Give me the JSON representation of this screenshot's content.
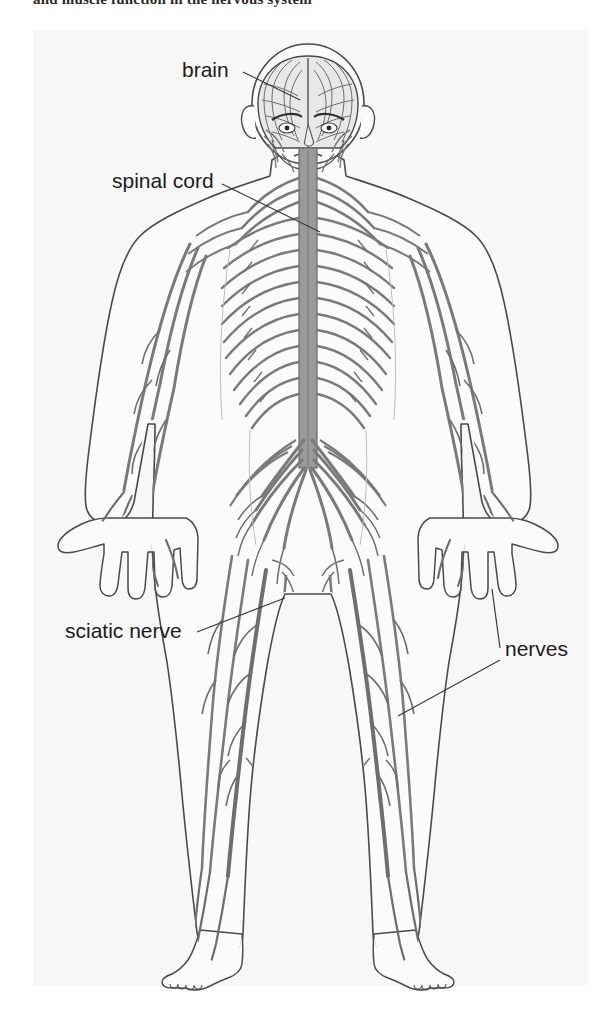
{
  "page": {
    "cropped_heading": "and muscle function in the nervous system",
    "background_color": "#ffffff",
    "panel_color": "#f7f7f7"
  },
  "figure": {
    "name": "human-nervous-system-diagram",
    "colors": {
      "nerve": "#7a7a7a",
      "nerve_dark": "#5e5e5e",
      "outline": "#4a4a4a",
      "body_fill": "#fbfbfb",
      "brain_fill": "#e8e8e8",
      "spinal_cord": "#9a9a9a",
      "label": "#1c1c1c",
      "leader": "#3a3a3a"
    },
    "labels": [
      {
        "id": "brain",
        "text": "brain",
        "text_x": 182,
        "text_y": 77,
        "anchor": "start",
        "leaders": [
          {
            "x1": 243,
            "y1": 72,
            "x2": 300,
            "y2": 100
          }
        ]
      },
      {
        "id": "spinal-cord",
        "text": "spinal cord",
        "text_x": 112,
        "text_y": 188,
        "anchor": "start",
        "leaders": [
          {
            "x1": 222,
            "y1": 184,
            "x2": 320,
            "y2": 232
          }
        ]
      },
      {
        "id": "sciatic-nerve",
        "text": "sciatic nerve",
        "text_x": 65,
        "text_y": 638,
        "anchor": "start",
        "leaders": [
          {
            "x1": 197,
            "y1": 632,
            "x2": 285,
            "y2": 598
          }
        ]
      },
      {
        "id": "nerves",
        "text": "nerves",
        "text_x": 505,
        "text_y": 656,
        "anchor": "start",
        "leaders": [
          {
            "x1": 500,
            "y1": 648,
            "x2": 492,
            "y2": 589
          },
          {
            "x1": 500,
            "y1": 660,
            "x2": 398,
            "y2": 716
          }
        ]
      }
    ]
  }
}
